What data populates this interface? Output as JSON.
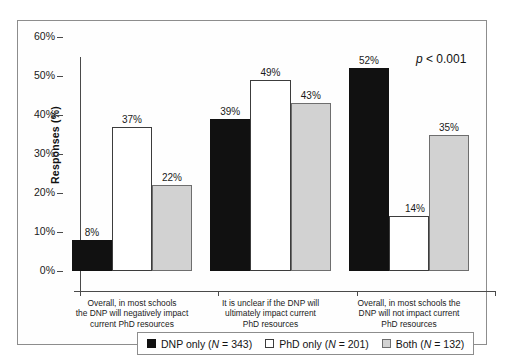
{
  "chart_data": {
    "type": "bar",
    "title": "",
    "subtitle": "",
    "xlabel": "",
    "ylabel": "Responses (%)",
    "ylim": [
      0,
      60
    ],
    "ytick_labels": [
      "0%",
      "10%",
      "20%",
      "30%",
      "40%",
      "50%",
      "60%"
    ],
    "ytick_values": [
      0,
      10,
      20,
      30,
      40,
      50,
      60
    ],
    "grid": false,
    "legend_position": "bottom",
    "categories": [
      "Overall, in most schools the DNP will negatively impact current PhD resources",
      "It is unclear if the DNP will ultimately impact current PhD resources",
      "Overall, in most schools the DNP will not impact current PhD resources"
    ],
    "category_lines": [
      [
        "Overall, in most schools",
        "the DNP will negatively impact",
        "current PhD resources"
      ],
      [
        "It is unclear if the DNP will",
        "ultimately impact current",
        "PhD resources"
      ],
      [
        "Overall, in most schools the",
        "DNP will not impact current",
        "PhD resources"
      ]
    ],
    "series": [
      {
        "name": "DNP only (N = 343)",
        "key": "dnp",
        "style": "black",
        "color": "#111111",
        "values": [
          8,
          39,
          52
        ],
        "labels": [
          "8%",
          "39%",
          "52%"
        ]
      },
      {
        "name": "PhD only (N = 201)",
        "key": "phd",
        "style": "white",
        "color": "#ffffff",
        "values": [
          37,
          49,
          14
        ],
        "labels": [
          "37%",
          "49%",
          "14%"
        ]
      },
      {
        "name": "Both (N = 132)",
        "key": "both",
        "style": "gray",
        "color": "#d2d2d2",
        "values": [
          22,
          43,
          35
        ],
        "labels": [
          "22%",
          "43%",
          "35%"
        ]
      }
    ],
    "annotations": [
      {
        "name": "p-value",
        "text_italic": "p",
        "text_rest": " < 0.001"
      }
    ]
  },
  "legend": {
    "items": [
      {
        "swatch": "black",
        "label_pre": "DNP only (",
        "label_italic": "N",
        "label_post": " = 343)"
      },
      {
        "swatch": "white",
        "label_pre": "PhD only (",
        "label_italic": "N",
        "label_post": " = 201)"
      },
      {
        "swatch": "gray",
        "label_pre": "Both (",
        "label_italic": "N",
        "label_post": " = 132)"
      }
    ]
  },
  "axis": {
    "y_title": "Responses (%)",
    "y_ticks": [
      {
        "label": "60%",
        "value": 60
      },
      {
        "label": "50%",
        "value": 50
      },
      {
        "label": "40%",
        "value": 40
      },
      {
        "label": "30%",
        "value": 30
      },
      {
        "label": "20%",
        "value": 20
      },
      {
        "label": "10%",
        "value": 10
      },
      {
        "label": "0%",
        "value": 0
      }
    ]
  }
}
